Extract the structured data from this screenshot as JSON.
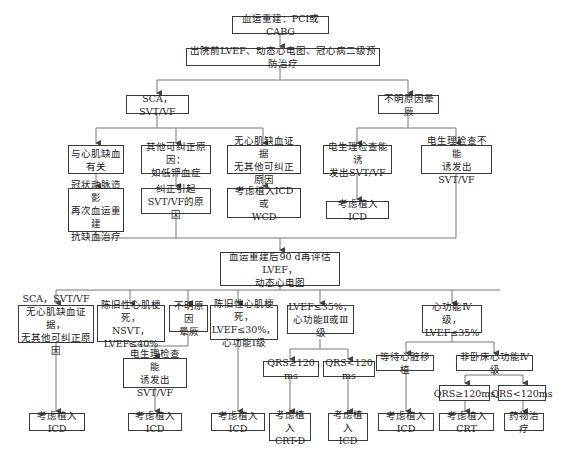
{
  "diagram": {
    "type": "flowchart",
    "nodes": {
      "n1": "血运重建：PCI或CABG",
      "n2": "出院前LVEF、动态心电图、冠心病二级预防治疗",
      "n3": "SCA，SVT/VF",
      "n4": "不明原因晕厥",
      "n5": "与心肌缺血\n有关",
      "n6": "其他可纠正原因：\n如低钾血症",
      "n7": "无心肌缺血证据\n无其他可纠正原因",
      "n8": "电生理检查能诱\n发出SVT/VF",
      "n9": "电生理检查不能\n诱发出SVT/VF",
      "n10": "冠状动脉造影\n再次血运重建\n抗缺血治疗",
      "n11": "纠正引起\nSVT/VF的原因",
      "n12": "考虑植入ICD或\nWCD",
      "n13": "考虑植入ICD",
      "n14": "血运重建后90 d再评估LVEF，\n动态心电图",
      "n15": "SCA，SVT/VF\n无心肌缺血证据，\n无其他可纠正原因",
      "n16": "陈旧性心肌梗死，\nNSVT，\nLVEF≤40%",
      "n17": "不明原因\n晕厥",
      "n18": "陈旧性心肌梗死，\nLVEF≤30%，\n心功能Ⅰ级",
      "n19": "LVEF≤35%，\n心功能Ⅱ或Ⅲ级",
      "n20": "心功能Ⅳ级，\nLVEF≤35%",
      "n21": "电生理检查能\n诱发出SVT/VF",
      "n22": "QRS≥120 ms",
      "n23": "QRS<120 ms",
      "n24": "等待心脏移植",
      "n25": "非卧床心功能Ⅳ级",
      "n26": "QRS≥120ms",
      "n27": "QRS<120ms",
      "n28": "考虑植入ICD",
      "n29": "考虑植入ICD",
      "n30": "考虑植入ICD",
      "n31": "考虑植入\nCRT-D",
      "n32": "考虑植入\nICD",
      "n33": "考虑植入ICD",
      "n34": "考虑植入CRT",
      "n35": "药物治疗"
    }
  }
}
